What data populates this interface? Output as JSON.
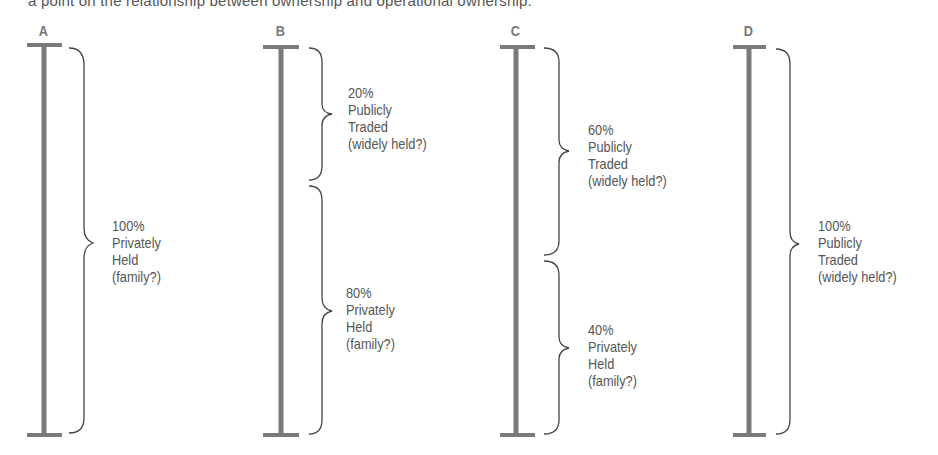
{
  "caption": "a point on the relationship between ownership and operational ownership.",
  "columns": [
    {
      "letter": "A",
      "segments": [
        {
          "percent": "100%",
          "line1": "Privately",
          "line2": "Held",
          "line3": "(family?)"
        }
      ]
    },
    {
      "letter": "B",
      "segments": [
        {
          "percent": "20%",
          "line1": "Publicly",
          "line2": "Traded",
          "line3": "(widely held?)"
        },
        {
          "percent": "80%",
          "line1": "Privately",
          "line2": "Held",
          "line3": "(family?)"
        }
      ]
    },
    {
      "letter": "C",
      "segments": [
        {
          "percent": "60%",
          "line1": "Publicly",
          "line2": "Traded",
          "line3": "(widely held?)"
        },
        {
          "percent": "40%",
          "line1": "Privately",
          "line2": "Held",
          "line3": "(family?)"
        }
      ]
    },
    {
      "letter": "D",
      "segments": [
        {
          "percent": "100%",
          "line1": "Publicly",
          "line2": "Traded",
          "line3": "(widely held?)"
        }
      ]
    }
  ],
  "colors": {
    "bar": "#7a7a7a",
    "brace": "#444444",
    "text": "#555555"
  }
}
